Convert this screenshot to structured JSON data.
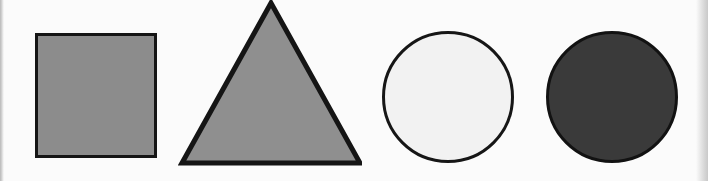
{
  "figure": {
    "width": 708,
    "height": 181,
    "background_color": "#fbfbfb",
    "shape_count": 4
  },
  "page_edges": {
    "left_label": "page-edge-left",
    "right_label": "page-edge-right",
    "edge_color": "#c9c9c9"
  },
  "shapes": [
    {
      "index": 1,
      "name": "square",
      "label": "Square",
      "fill_color": "#8c8c8c",
      "fill_name": "medium gray",
      "stroke_color": "#151515",
      "stroke_width": 3,
      "x": 35,
      "y": 33,
      "width": 122,
      "height": 125
    },
    {
      "index": 2,
      "name": "triangle",
      "label": "Triangle",
      "fill_color": "#8f8f8f",
      "fill_name": "medium gray",
      "stroke_color": "#151515",
      "stroke_width": 4,
      "apex_x": 271,
      "apex_y": 3,
      "base_left_x": 182,
      "base_right_x": 357,
      "base_y": 160
    },
    {
      "index": 3,
      "name": "circle-light",
      "label": "Light circle",
      "fill_color": "#f2f2f2",
      "fill_name": "near white",
      "stroke_color": "#161616",
      "stroke_width": 3,
      "center_x": 448,
      "center_y": 97,
      "radius": 66
    },
    {
      "index": 4,
      "name": "circle-dark",
      "label": "Dark circle",
      "fill_color": "#3a3a3a",
      "fill_name": "dark gray",
      "stroke_color": "#121212",
      "stroke_width": 3,
      "center_x": 612,
      "center_y": 97,
      "radius": 66
    }
  ],
  "triangle_points": "93,3 4,163 182,163"
}
